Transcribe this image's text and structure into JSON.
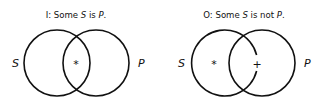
{
  "diagrams": [
    {
      "title_prefix": "I:  Some ",
      "title_s": "S",
      "title_mid": " is ",
      "title_p": "P",
      "title_end": ".",
      "left_label": "S",
      "right_label": "P",
      "marks": [
        {
          "symbol": "*",
          "region": "intersection"
        }
      ]
    },
    {
      "title_prefix": "O:  Some ",
      "title_s": "S",
      "title_mid": " is not ",
      "title_p": "P",
      "title_end": ".",
      "left_label": "S",
      "right_label": "P",
      "marks": [
        {
          "symbol": "*",
          "region": "S only"
        },
        {
          "symbol": "+",
          "region": "intersection boundary"
        }
      ]
    }
  ]
}
